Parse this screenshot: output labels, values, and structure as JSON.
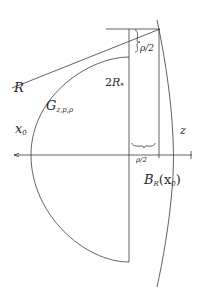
{
  "diagram": {
    "type": "geometric-figure",
    "colors": {
      "stroke": "#3a3a3a",
      "background": "#ffffff",
      "text": "#2a2a2a"
    },
    "labels": {
      "R": "R",
      "G_main": "G",
      "G_sub": "z,p,ρ",
      "two_R_num": "2",
      "two_R_main": "R",
      "two_R_sub": "*",
      "x0_main": "x",
      "x0_sub": "0",
      "z": "z",
      "rho_half_top": "ρ/2",
      "rho_half_bottom": "ρ/2",
      "B_main": "B",
      "B_sub": "R",
      "B_arg": "(x",
      "B_arg_sub": "0",
      "B_close": ")"
    },
    "elements": [
      "horizontal axis with left arrow",
      "semicircle G bounded by vertical chord",
      "vertical lines at chord and ρ/2 offset",
      "top horizontal segment",
      "line R from left to top corner",
      "large arc of ball B_R(x0)",
      "brace marking ρ/2 vertically",
      "brace marking ρ/2 horizontally"
    ]
  }
}
